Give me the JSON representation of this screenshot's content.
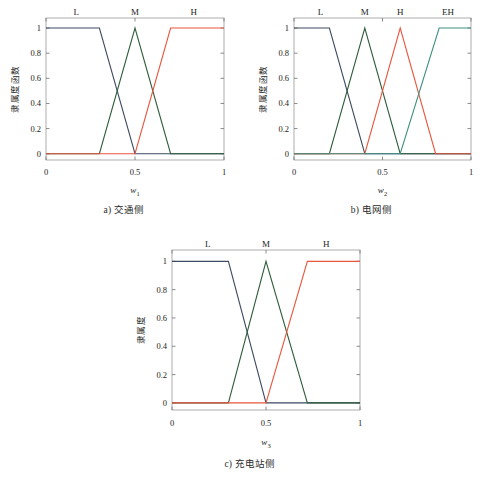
{
  "figure": {
    "panels": [
      {
        "id": "a",
        "caption": "a) 交通侧",
        "chart_data": {
          "type": "line",
          "title": "",
          "xlabel": "w",
          "xlabel_sub": "1",
          "ylabel": "隶属度函数",
          "xlim": [
            0,
            1
          ],
          "ylim": [
            -0.05,
            1.08
          ],
          "xticks": [
            0,
            0.5,
            1
          ],
          "xticklabels": [
            "0",
            "0.5",
            "1"
          ],
          "yticks": [
            0,
            0.2,
            0.4,
            0.6,
            0.8,
            1
          ],
          "yticklabels": [
            "0",
            "0.2",
            "0.4",
            "0.6",
            "0.8",
            "1"
          ],
          "grid": false,
          "legend": "inline-top-labels",
          "series": [
            {
              "name": "L",
              "color": "#3d4a63",
              "label_x": 0.17,
              "points": [
                [
                  0,
                  1
                ],
                [
                  0.3,
                  1
                ],
                [
                  0.5,
                  0
                ],
                [
                  1,
                  0
                ]
              ]
            },
            {
              "name": "M",
              "color": "#2f5d3a",
              "label_x": 0.5,
              "points": [
                [
                  0,
                  0
                ],
                [
                  0.3,
                  0
                ],
                [
                  0.5,
                  1
                ],
                [
                  0.7,
                  0
                ],
                [
                  1,
                  0
                ]
              ]
            },
            {
              "name": "H",
              "color": "#e8563c",
              "label_x": 0.83,
              "points": [
                [
                  0,
                  0
                ],
                [
                  0.5,
                  0
                ],
                [
                  0.7,
                  1
                ],
                [
                  1,
                  1
                ]
              ]
            }
          ]
        }
      },
      {
        "id": "b",
        "caption": "b) 电网侧",
        "chart_data": {
          "type": "line",
          "title": "",
          "xlabel": "w",
          "xlabel_sub": "2",
          "ylabel": "隶属度函数",
          "xlim": [
            0,
            1
          ],
          "ylim": [
            -0.05,
            1.08
          ],
          "xticks": [
            0,
            0.5,
            1
          ],
          "xticklabels": [
            "0",
            "0.5",
            "1"
          ],
          "yticks": [
            0,
            0.2,
            0.4,
            0.6,
            0.8,
            1
          ],
          "yticklabels": [
            "0",
            "0.2",
            "0.4",
            "0.6",
            "0.8",
            "1"
          ],
          "grid": false,
          "legend": "inline-top-labels",
          "series": [
            {
              "name": "L",
              "color": "#3d4a63",
              "label_x": 0.15,
              "points": [
                [
                  0,
                  1
                ],
                [
                  0.2,
                  1
                ],
                [
                  0.4,
                  0
                ],
                [
                  1,
                  0
                ]
              ]
            },
            {
              "name": "M",
              "color": "#2f5d3a",
              "label_x": 0.4,
              "points": [
                [
                  0,
                  0
                ],
                [
                  0.2,
                  0
                ],
                [
                  0.4,
                  1
                ],
                [
                  0.6,
                  0
                ],
                [
                  1,
                  0
                ]
              ]
            },
            {
              "name": "H",
              "color": "#e8563c",
              "label_x": 0.6,
              "points": [
                [
                  0,
                  0
                ],
                [
                  0.4,
                  0
                ],
                [
                  0.6,
                  1
                ],
                [
                  0.8,
                  0
                ],
                [
                  1,
                  0
                ]
              ]
            },
            {
              "name": "EH",
              "color": "#3f8f82",
              "label_x": 0.87,
              "points": [
                [
                  0,
                  0
                ],
                [
                  0.6,
                  0
                ],
                [
                  0.82,
                  1
                ],
                [
                  1,
                  1
                ]
              ]
            }
          ]
        }
      },
      {
        "id": "c",
        "caption": "c) 充电站侧",
        "chart_data": {
          "type": "line",
          "title": "",
          "xlabel": "w",
          "xlabel_sub": "3",
          "ylabel": "隶属度",
          "xlim": [
            0,
            1
          ],
          "ylim": [
            -0.05,
            1.08
          ],
          "xticks": [
            0,
            0.5,
            1
          ],
          "xticklabels": [
            "0",
            "0.5",
            "1"
          ],
          "yticks": [
            0,
            0.2,
            0.4,
            0.6,
            0.8,
            1
          ],
          "yticklabels": [
            "0",
            "0.2",
            "0.4",
            "0.6",
            "0.8",
            "1"
          ],
          "grid": false,
          "legend": "inline-top-labels",
          "series": [
            {
              "name": "L",
              "color": "#3d4a63",
              "label_x": 0.19,
              "points": [
                [
                  0,
                  1
                ],
                [
                  0.3,
                  1
                ],
                [
                  0.5,
                  0
                ],
                [
                  1,
                  0
                ]
              ]
            },
            {
              "name": "M",
              "color": "#2f5d3a",
              "label_x": 0.5,
              "points": [
                [
                  0,
                  0
                ],
                [
                  0.3,
                  0
                ],
                [
                  0.5,
                  1
                ],
                [
                  0.72,
                  0
                ],
                [
                  1,
                  0
                ]
              ]
            },
            {
              "name": "H",
              "color": "#e8563c",
              "label_x": 0.82,
              "points": [
                [
                  0,
                  0
                ],
                [
                  0.5,
                  0
                ],
                [
                  0.72,
                  1
                ],
                [
                  1,
                  1
                ]
              ]
            }
          ]
        }
      }
    ]
  }
}
